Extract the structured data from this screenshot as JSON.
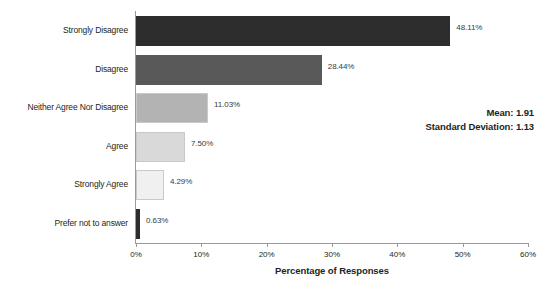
{
  "chart_data": {
    "type": "bar",
    "orientation": "horizontal",
    "title": "",
    "xlabel": "Percentage of Responses",
    "ylabel": "",
    "xlim": [
      0,
      60
    ],
    "grid": false,
    "legend": null,
    "categories": [
      "Strongly Disagree",
      "Disagree",
      "Neither Agree Nor Disagree",
      "Agree",
      "Strongly Agree",
      "Prefer not to answer"
    ],
    "values": [
      48.11,
      28.44,
      11.03,
      7.5,
      4.29,
      0.63
    ],
    "value_labels": [
      "48.11%",
      "28.44%",
      "11.03%",
      "7.50%",
      "4.29%",
      "0.63%"
    ],
    "bar_colors": [
      "#2d2d2d",
      "#595959",
      "#b3b3b3",
      "#d9d9d9",
      "#f0f0f0",
      "#2d2d2d"
    ],
    "xticks": [
      0,
      10,
      20,
      30,
      40,
      50,
      60
    ],
    "xtick_labels": [
      "0%",
      "10%",
      "20%",
      "30%",
      "40%",
      "50%",
      "60%"
    ],
    "annotations": {
      "mean_label": "Mean: 1.91",
      "std_label": "Standard Deviation: 1.13",
      "mean_value": 1.91,
      "std_value": 1.13
    }
  }
}
